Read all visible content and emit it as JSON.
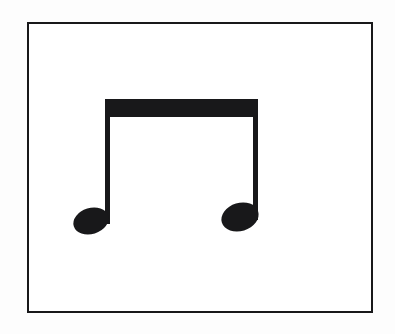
{
  "image": {
    "kind": "music-notation-figure",
    "subject": "beamed-eighth-note-pair",
    "background_color": "#ffffff",
    "outer_background_color": "#fdfdfd",
    "ink_color": "#18181a",
    "width": 395,
    "height": 334
  },
  "frame": {
    "name": "rectangular-border",
    "x": 27,
    "y": 22,
    "width": 346,
    "height": 291,
    "stroke_width": 2,
    "stroke_color": "#18181a",
    "fill_color": "#ffffff"
  },
  "notation": {
    "symbol_name": "two-beamed-eighth-notes",
    "note_count": 2,
    "beam": {
      "name": "beam",
      "x": 105,
      "y": 99,
      "width": 153,
      "height": 18,
      "color": "#18181a"
    },
    "notes": [
      {
        "name": "eighth-note-left",
        "notehead": {
          "center_x": 91,
          "center_y": 221,
          "radius_x": 18,
          "radius_y": 13,
          "rotation_deg": -17,
          "color": "#18181a"
        },
        "stem": {
          "x": 105,
          "y_top": 99,
          "y_bottom": 224,
          "width": 5,
          "color": "#18181a"
        }
      },
      {
        "name": "eighth-note-right",
        "notehead": {
          "center_x": 240,
          "center_y": 217,
          "radius_x": 19,
          "radius_y": 14,
          "rotation_deg": -17,
          "color": "#18181a"
        },
        "stem": {
          "x": 253,
          "y_top": 99,
          "y_bottom": 220,
          "width": 5,
          "color": "#18181a"
        }
      }
    ]
  }
}
